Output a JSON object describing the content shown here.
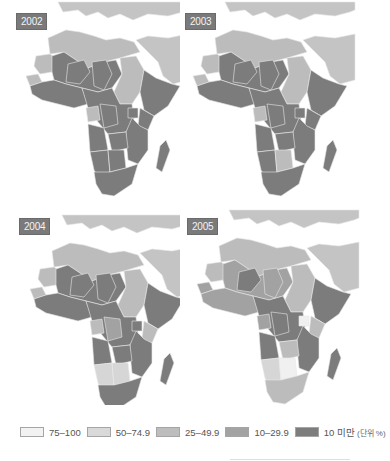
{
  "panels": [
    {
      "year": "2002",
      "regions": {
        "north": "c3",
        "sahel": "c5",
        "west": "c5",
        "gabon": "c3",
        "sudan": "c3",
        "horn": "c5",
        "central": "c5",
        "east": "c5",
        "southwest": "c5",
        "botswana": "c5",
        "south": "c5",
        "madagascar": "c5",
        "mauritania": "c3",
        "senegal": "c3"
      }
    },
    {
      "year": "2003",
      "regions": {
        "north": "c3",
        "sahel": "c5",
        "west": "c5",
        "gabon": "c3",
        "sudan": "c3",
        "horn": "c5",
        "central": "c5",
        "east": "c5",
        "southwest": "c5",
        "botswana": "c3",
        "south": "c5",
        "madagascar": "c5",
        "mauritania": "c3",
        "senegal": "c3"
      }
    },
    {
      "year": "2004",
      "regions": {
        "north": "c3",
        "sahel": "c5",
        "west": "c5",
        "gabon": "c3",
        "sudan": "c3",
        "horn": "c5",
        "central": "c5",
        "east": "c5",
        "southwest": "c2",
        "botswana": "c2",
        "south": "c5",
        "madagascar": "c5",
        "mauritania": "c3",
        "senegal": "c3",
        "kenya": "c3",
        "congo": "c4"
      }
    },
    {
      "year": "2005",
      "regions": {
        "north": "c3",
        "sahel": "c4",
        "west": "c4",
        "gabon": "c4",
        "sudan": "c3",
        "horn": "c5",
        "central": "c5",
        "east": "c5",
        "southwest": "c2",
        "botswana": "c1",
        "south": "c3",
        "madagascar": "c5",
        "mauritania": "c3",
        "senegal": "c4",
        "niger": "c5",
        "chad": "c4",
        "angola": "c5",
        "zambia": "c3",
        "uganda": "c1",
        "kenya": "c3"
      }
    }
  ],
  "legend": {
    "items": [
      {
        "label": "75–100",
        "color": "#f2f2f2"
      },
      {
        "label": "50–74.9",
        "color": "#d9d9d9"
      },
      {
        "label": "25–49.9",
        "color": "#bdbdbd"
      },
      {
        "label": "10–29.9",
        "color": "#a3a3a3"
      },
      {
        "label": "10 미만",
        "color": "#7d7d7d"
      }
    ],
    "unit": "(단위 %)"
  },
  "colors": {
    "c1": "#f0f0f0",
    "c2": "#d6d6d6",
    "c3": "#bcbcbc",
    "c4": "#a2a2a2",
    "c5": "#7c7c7c",
    "other_land": "#c4c4c4",
    "sea": "#ffffff",
    "border": "#e8e8e8"
  }
}
